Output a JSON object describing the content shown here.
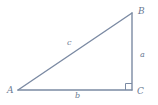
{
  "figure": {
    "type": "right-triangle-diagram",
    "background_color": "#ffffff",
    "stroke_color": "#7b8aa3",
    "label_color": "#6a7a93",
    "vertices": [
      {
        "name": "A",
        "label": "A",
        "x": 18,
        "y": 90,
        "angle": "acute"
      },
      {
        "name": "B",
        "label": "B",
        "x": 132,
        "y": 13,
        "angle": "acute"
      },
      {
        "name": "C",
        "label": "C",
        "x": 132,
        "y": 90,
        "angle": "right"
      }
    ],
    "sides": [
      {
        "name": "a",
        "label": "a",
        "from": "B",
        "to": "C",
        "description": "vertical leg"
      },
      {
        "name": "b",
        "label": "b",
        "from": "A",
        "to": "C",
        "description": "horizontal leg"
      },
      {
        "name": "c",
        "label": "c",
        "from": "A",
        "to": "B",
        "description": "hypotenuse"
      }
    ],
    "right_angle_marker": {
      "at_vertex": "C",
      "label": "right-angle-square",
      "size": 6
    }
  }
}
